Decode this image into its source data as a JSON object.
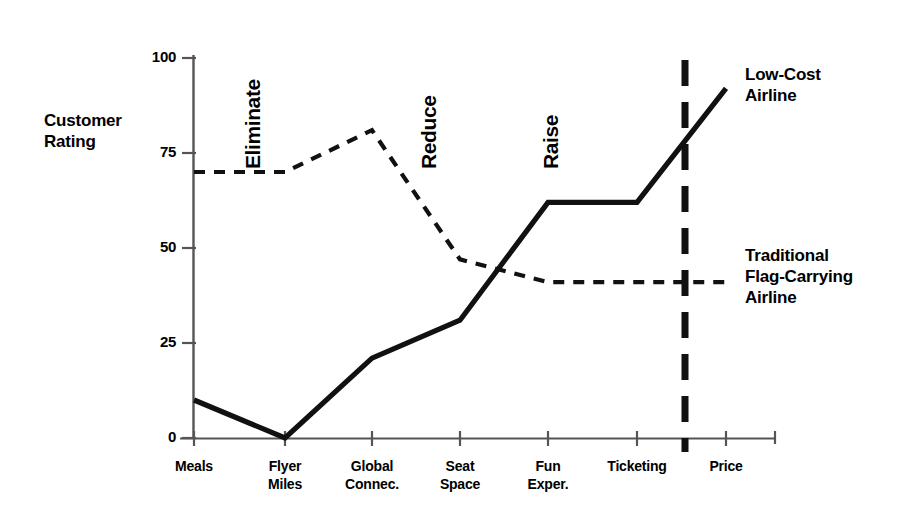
{
  "chart_data": {
    "type": "line",
    "title": "",
    "xlabel": "",
    "ylabel": "Customer Rating",
    "ylim": [
      0,
      100
    ],
    "yticks": [
      0,
      25,
      50,
      75,
      100
    ],
    "grid": false,
    "legend_position": "right-inline",
    "categories": [
      "Meals",
      "Flyer Miles",
      "Global Connec.",
      "Seat Space",
      "Fun Exper.",
      "Ticketing",
      "Price"
    ],
    "series": [
      {
        "name": "Low-Cost Airline",
        "style": "solid",
        "values": [
          10,
          0,
          21,
          31,
          62,
          62,
          92
        ]
      },
      {
        "name": "Traditional Flag-Carrying Airline",
        "style": "dashed",
        "values": [
          70,
          70,
          81,
          47,
          41,
          41,
          41
        ]
      }
    ],
    "annotations": [
      {
        "text": "Eliminate",
        "at_category": "Flyer Miles",
        "orientation": "vertical"
      },
      {
        "text": "Reduce",
        "at_category": "Seat Space",
        "orientation": "vertical"
      },
      {
        "text": "Raise",
        "at_category": "Fun Exper.",
        "orientation": "vertical"
      }
    ],
    "divider": {
      "style": "dashed-vertical",
      "between": [
        "Ticketing",
        "Price"
      ]
    }
  },
  "axis": {
    "y_title_line1": "Customer",
    "y_title_line2": "Rating",
    "y_tick_labels": [
      "100",
      "75",
      "50",
      "25",
      "0"
    ]
  },
  "x_labels": [
    {
      "line1": "Meals",
      "line2": ""
    },
    {
      "line1": "Flyer",
      "line2": "Miles"
    },
    {
      "line1": "Global",
      "line2": "Connec."
    },
    {
      "line1": "Seat",
      "line2": "Space"
    },
    {
      "line1": "Fun",
      "line2": "Exper."
    },
    {
      "line1": "Ticketing",
      "line2": ""
    },
    {
      "line1": "Price",
      "line2": ""
    }
  ],
  "annotations": {
    "eliminate": "Eliminate",
    "reduce": "Reduce",
    "raise": "Raise"
  },
  "legend": {
    "lowcost_line1": "Low-Cost",
    "lowcost_line2": "Airline",
    "traditional_line1": "Traditional",
    "traditional_line2": "Flag-Carrying",
    "traditional_line3": "Airline"
  },
  "colors": {
    "ink": "#111111",
    "axis": "#555555",
    "background": "#ffffff"
  }
}
